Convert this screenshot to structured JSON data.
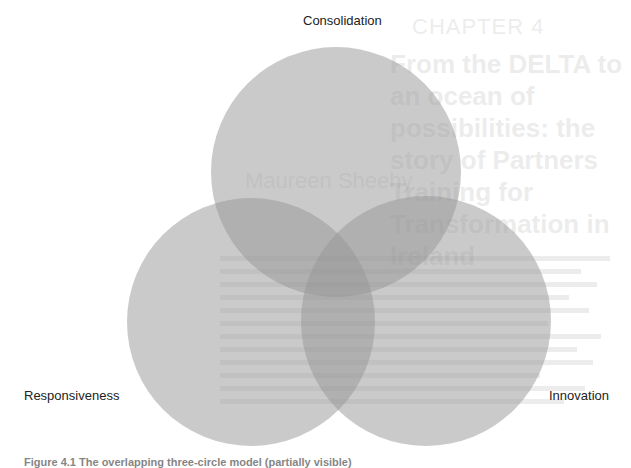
{
  "background_page": {
    "chapter": "CHAPTER 4",
    "title": "From the DELTA to an ocean of possibilities: the story of Partners Training for Transformation in Ireland",
    "author": "Maureen Sheehy"
  },
  "diagram": {
    "type": "venn",
    "circles": [
      {
        "id": "consolidation",
        "label": "Consolidation",
        "cx": 336,
        "cy": 172,
        "r": 125
      },
      {
        "id": "responsiveness",
        "label": "Responsiveness",
        "cx": 251,
        "cy": 322,
        "r": 124
      },
      {
        "id": "innovation",
        "label": "Innovation",
        "cx": 426,
        "cy": 321,
        "r": 125
      }
    ],
    "fill_color": "#969696",
    "fill_opacity": 0.5
  },
  "labels": {
    "top": "Consolidation",
    "left": "Responsiveness",
    "right": "Innovation"
  },
  "caption": "Figure 4.1 The overlapping three-circle model (partially visible)"
}
